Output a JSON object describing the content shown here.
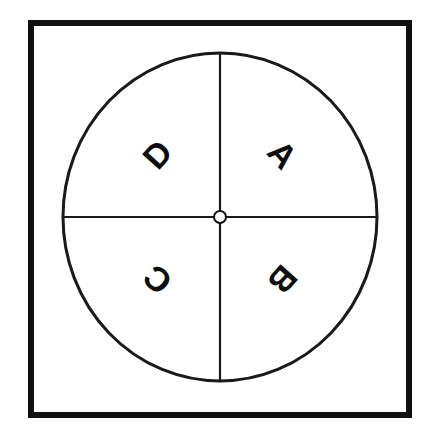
{
  "diagram": {
    "background_color": "#ffffff",
    "ink_color": "#111111",
    "frame": {
      "name": "square-border",
      "stroke_color": "#111111",
      "stroke_width": 6
    },
    "circle": {
      "name": "main-circle",
      "center_x": 220,
      "center_y": 217,
      "radius_x": 157,
      "radius_y": 164,
      "stroke_color": "#1a1a1a",
      "stroke_width": 3
    },
    "axes": {
      "vertical": {
        "name": "vertical-diameter",
        "x": 220,
        "y1": 53,
        "y2": 382,
        "stroke_width": 2
      },
      "horizontal": {
        "name": "horizontal-diameter",
        "y": 217,
        "x1": 63,
        "x2": 377,
        "stroke_width": 2
      }
    },
    "center_marker": {
      "name": "center-dot",
      "x": 220,
      "y": 217,
      "radius": 6,
      "stroke_width": 2
    },
    "quadrants": [
      {
        "id": "A",
        "label": "A",
        "position": "upper-right",
        "angle_deg": 45,
        "rotation_deg": 48
      },
      {
        "id": "B",
        "label": "B",
        "position": "lower-right",
        "angle_deg": 135,
        "rotation_deg": 132
      },
      {
        "id": "C",
        "label": "C",
        "position": "lower-left",
        "angle_deg": 225,
        "rotation_deg": 222
      },
      {
        "id": "D",
        "label": "D",
        "position": "upper-left",
        "angle_deg": 315,
        "rotation_deg": 312
      }
    ]
  },
  "chart_data": {
    "type": "pie",
    "categories": [
      "A",
      "B",
      "C",
      "D"
    ],
    "values": [
      25,
      25,
      25,
      25
    ],
    "xlabel": "",
    "ylabel": "",
    "legend": "none",
    "grid": false,
    "annotations": [
      "A placed in upper-right quadrant, rotated radially outward",
      "B placed in lower-right quadrant, rotated radially outward",
      "C placed in lower-left quadrant, rotated radially outward",
      "D placed in upper-left quadrant, rotated radially outward"
    ]
  }
}
